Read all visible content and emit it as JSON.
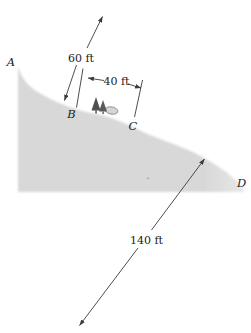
{
  "figure": {
    "type": "hillside-measurement-diagram",
    "background": "#ffffff",
    "colors": {
      "hill_fill": "#d8d8d8",
      "line": "#3a3a3a",
      "text": "#1c1c1c"
    },
    "points": [
      {
        "label": "A"
      },
      {
        "label": "B"
      },
      {
        "label": "C"
      },
      {
        "label": "D"
      }
    ],
    "measurements": [
      {
        "label": "60 ft"
      },
      {
        "label": "40 ft"
      },
      {
        "label": "140 ft"
      }
    ],
    "icons": [
      {
        "name": "trees-rock-icon"
      }
    ]
  }
}
